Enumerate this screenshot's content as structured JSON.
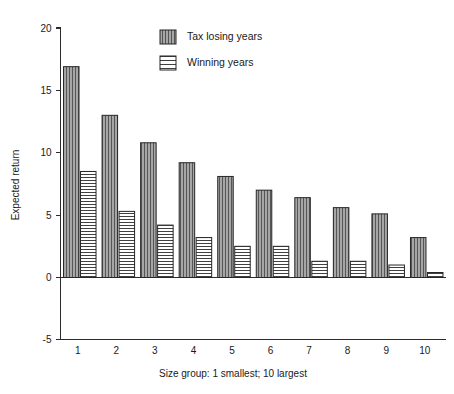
{
  "chart_data": {
    "type": "bar",
    "title": "",
    "xlabel": "Size group: 1 smallest; 10 largest",
    "ylabel": "Expected return",
    "categories": [
      "1",
      "2",
      "3",
      "4",
      "5",
      "6",
      "7",
      "8",
      "9",
      "10"
    ],
    "series": [
      {
        "name": "Tax losing years",
        "pattern": "vertical-hatch",
        "color": "#9a9a9a",
        "values": [
          16.9,
          13.0,
          10.8,
          9.2,
          8.1,
          7.0,
          6.4,
          5.6,
          5.1,
          3.2
        ]
      },
      {
        "name": "Winning years",
        "pattern": "horizontal-hatch",
        "color": "#ffffff",
        "values": [
          8.5,
          5.3,
          4.2,
          3.2,
          2.5,
          2.5,
          1.3,
          1.3,
          1.0,
          0.4
        ]
      }
    ],
    "yticks": [
      20,
      15,
      10,
      5,
      0,
      -5
    ],
    "ytick_labels": [
      "20",
      "15",
      "10",
      "5",
      "0",
      "-5"
    ],
    "ylim": [
      -5,
      20
    ],
    "grid": false,
    "legend_position": "top-center",
    "legend_entries": [
      "Tax losing years",
      "Winning years"
    ]
  },
  "axes": {
    "y_title": "Expected return",
    "x_title": "Size group: 1 smallest; 10 largest"
  }
}
